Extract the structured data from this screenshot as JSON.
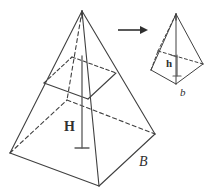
{
  "figure": {
    "background_color": "#ffffff",
    "stroke_color": "#404040",
    "labels": {
      "large_height": "H",
      "large_base": "B",
      "small_height": "h",
      "small_base": "b"
    },
    "arrow": {
      "name": "scaling-arrow",
      "from_x": 118,
      "to_x": 148,
      "y": 30
    },
    "large_pyramid": {
      "name": "large-pyramid",
      "apex": [
        82,
        11
      ],
      "base_front_left": [
        10,
        153
      ],
      "base_front_bottom": [
        99,
        186
      ],
      "base_front_right": [
        155,
        134
      ],
      "base_back_hidden": [
        67,
        100
      ],
      "cross_section": {
        "left": [
          44,
          83
        ],
        "bottom": [
          88,
          99
        ],
        "right": [
          116,
          73
        ],
        "back_hidden": [
          72,
          57
        ]
      },
      "height_line": {
        "top_x": 82,
        "top_y": 56,
        "bottom_y": 148,
        "tick_half_width": 7
      }
    },
    "small_pyramid": {
      "name": "small-pyramid",
      "apex": [
        176,
        14
      ],
      "base_front_left": [
        151,
        70
      ],
      "base_front_bottom": [
        176,
        84
      ],
      "base_front_right": [
        203,
        64
      ],
      "base_back_hidden": [
        158,
        51
      ],
      "height_line": {
        "top_x": 176,
        "top_y": 55,
        "bottom_y": 76,
        "tick_half_width": 4
      }
    }
  }
}
